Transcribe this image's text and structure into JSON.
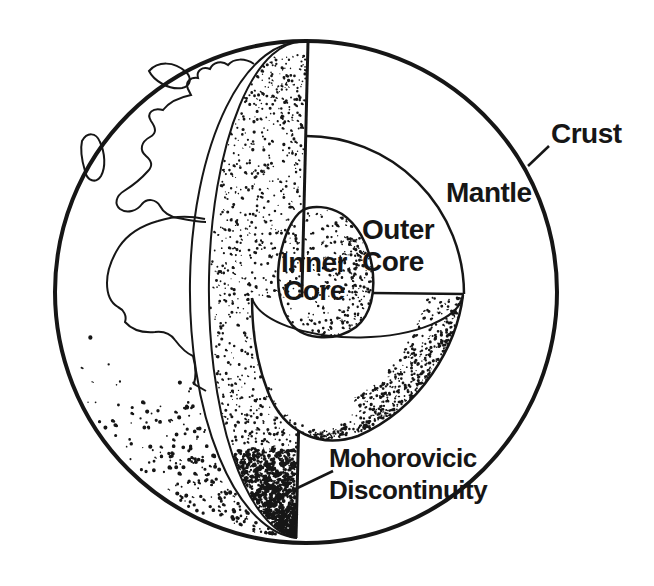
{
  "figure": {
    "background": "#ffffff",
    "ink": "#161616",
    "labels": {
      "crust": "Crust",
      "mantle": "Mantle",
      "outer_core": {
        "line1": "Outer",
        "line2": "Core"
      },
      "inner_core": {
        "line1": "Inner",
        "line2": "Core"
      },
      "moho": {
        "line1": "Mohorovicic",
        "line2": "Discontinuity"
      }
    }
  }
}
